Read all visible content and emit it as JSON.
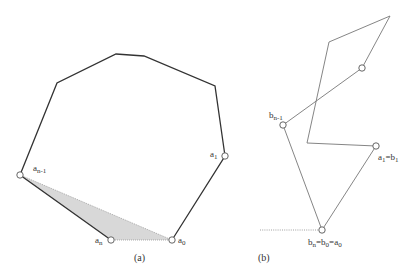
{
  "colors": {
    "polygon_stroke": "#333333",
    "thin_stroke": "#777777",
    "shade_fill": "#d8d8d8",
    "vertex_fill": "#ffffff",
    "vertex_stroke": "#555555"
  },
  "panel_a": {
    "caption": "(a)",
    "labels": {
      "a_n_minus_1": {
        "base": "a",
        "sub": "n-1"
      },
      "a_1": {
        "base": "a",
        "sub": "1"
      },
      "a_n": {
        "base": "a",
        "sub": "n"
      },
      "a_0": {
        "base": "a",
        "sub": "0"
      }
    },
    "polygon_points": [
      [
        20,
        175
      ],
      [
        57,
        83
      ],
      [
        116,
        54
      ],
      [
        144,
        56
      ],
      [
        215,
        86
      ],
      [
        225,
        156
      ],
      [
        172,
        240
      ]
    ],
    "hull_edge_last": [
      [
        20,
        175
      ],
      [
        111,
        240
      ]
    ],
    "shaded_triangle": [
      [
        20,
        175
      ],
      [
        111,
        240
      ],
      [
        172,
        240
      ]
    ],
    "vertices": {
      "a_n_minus_1": [
        20,
        175
      ],
      "a_1": [
        225,
        156
      ],
      "a_n": [
        111,
        240
      ],
      "a_0": [
        172,
        240
      ]
    }
  },
  "panel_b": {
    "caption": "(b)",
    "labels": {
      "b_n_minus_1": {
        "base": "b",
        "sub": "n-1"
      },
      "a1_eq_b1": {
        "parts": [
          {
            "base": "a",
            "sub": "1"
          },
          {
            "base": "=b",
            "sub": "1"
          }
        ]
      },
      "bn_eq_b0_eq_a0": {
        "parts": [
          {
            "base": "b",
            "sub": "n"
          },
          {
            "base": "=b",
            "sub": "0"
          },
          {
            "base": "=a",
            "sub": "0"
          }
        ]
      }
    },
    "path_points": [
      [
        322,
        230
      ],
      [
        376,
        146
      ],
      [
        307,
        143
      ],
      [
        329,
        42
      ],
      [
        390,
        16
      ],
      [
        362,
        68
      ],
      [
        283,
        125
      ],
      [
        322,
        230
      ]
    ],
    "dotted_baseline": [
      [
        260,
        230
      ],
      [
        318,
        230
      ]
    ],
    "vertices": {
      "b_n": [
        322,
        230
      ],
      "b_1": [
        376,
        146
      ],
      "mid": [
        362,
        68
      ],
      "b_n_minus_1": [
        283,
        125
      ]
    }
  }
}
